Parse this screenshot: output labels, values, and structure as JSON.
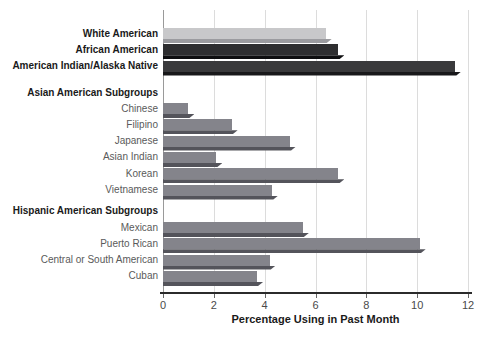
{
  "chart_data": {
    "type": "bar",
    "orientation": "horizontal",
    "title": "",
    "xlabel": "Percentage Using in Past Month",
    "ylabel": "",
    "xlim": [
      0,
      12
    ],
    "xticks": [
      0,
      2,
      4,
      6,
      8,
      10,
      12
    ],
    "gridlines": true,
    "legend": "none",
    "rows": [
      {
        "kind": "bar",
        "label": "White American",
        "value": 6.4,
        "bold": true,
        "color": "#c8c8ca",
        "shadow": "#9b9b9f"
      },
      {
        "kind": "bar",
        "label": "African American",
        "value": 6.9,
        "bold": true,
        "color": "#2e2e30",
        "shadow": "#0e0e10"
      },
      {
        "kind": "bar",
        "label": "American Indian/Alaska Native",
        "value": 11.5,
        "bold": true,
        "color": "#3a3a3c",
        "shadow": "#18181a"
      },
      {
        "kind": "header",
        "label": "Asian American Subgroups"
      },
      {
        "kind": "bar",
        "label": "Chinese",
        "value": 1.0,
        "bold": false,
        "color": "#84848b",
        "shadow": "#54545b"
      },
      {
        "kind": "bar",
        "label": "Filipino",
        "value": 2.7,
        "bold": false,
        "color": "#84848b",
        "shadow": "#54545b"
      },
      {
        "kind": "bar",
        "label": "Japanese",
        "value": 5.0,
        "bold": false,
        "color": "#84848b",
        "shadow": "#54545b"
      },
      {
        "kind": "bar",
        "label": "Asian Indian",
        "value": 2.1,
        "bold": false,
        "color": "#84848b",
        "shadow": "#54545b"
      },
      {
        "kind": "bar",
        "label": "Korean",
        "value": 6.9,
        "bold": false,
        "color": "#84848b",
        "shadow": "#54545b"
      },
      {
        "kind": "bar",
        "label": "Vietnamese",
        "value": 4.3,
        "bold": false,
        "color": "#84848b",
        "shadow": "#54545b"
      },
      {
        "kind": "header",
        "label": "Hispanic American Subgroups"
      },
      {
        "kind": "bar",
        "label": "Mexican",
        "value": 5.5,
        "bold": false,
        "color": "#84848b",
        "shadow": "#54545b"
      },
      {
        "kind": "bar",
        "label": "Puerto Rican",
        "value": 10.1,
        "bold": false,
        "color": "#84848b",
        "shadow": "#54545b"
      },
      {
        "kind": "bar",
        "label": "Central or South American",
        "value": 4.2,
        "bold": false,
        "color": "#84848b",
        "shadow": "#54545b"
      },
      {
        "kind": "bar",
        "label": "Cuban",
        "value": 3.7,
        "bold": false,
        "color": "#84848b",
        "shadow": "#54545b"
      }
    ]
  },
  "colors": {
    "background": "#ffffff",
    "gridline": "#dcdcdc",
    "bottom_axis_line": "#2b2b2b",
    "left_axis_line": "#9a9a9a",
    "tick_label": "#4a4a4a",
    "subgroup_label": "#5a5a5a",
    "group_label": "#1a1a1a"
  }
}
